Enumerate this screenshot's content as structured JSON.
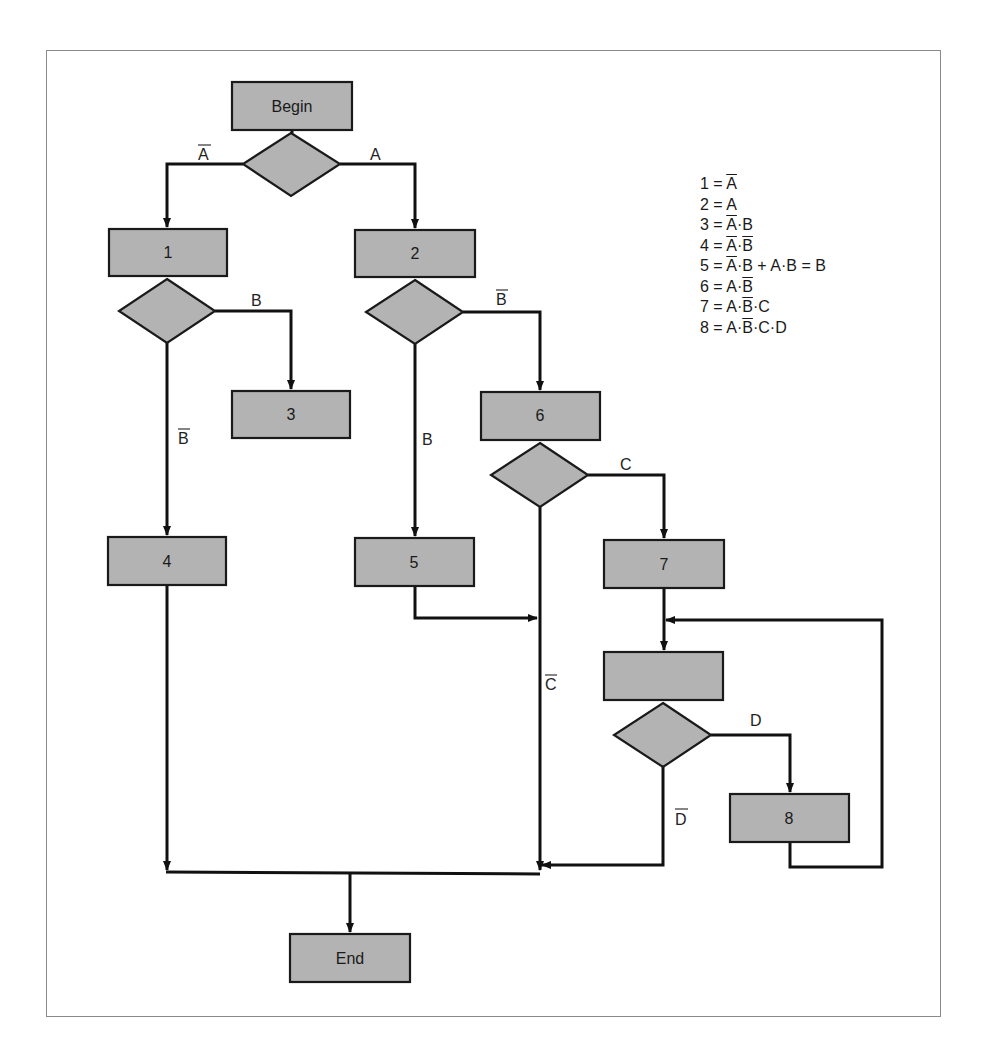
{
  "nodes": {
    "begin": "Begin",
    "p1": "1",
    "p2": "2",
    "p3": "3",
    "p4": "4",
    "p5": "5",
    "p6": "6",
    "p7": "7",
    "p_unlabeled": "",
    "p8": "8",
    "end": "End"
  },
  "edge_labels": {
    "not_a": "A",
    "a": "A",
    "b_from_1": "B",
    "not_b_from_1": "B",
    "not_b_from_2": "B",
    "b_from_2": "B",
    "c": "C",
    "not_c": "C",
    "d": "D",
    "not_d": "D"
  },
  "legend": [
    {
      "num": "1",
      "expr": [
        {
          "t": "A",
          "bar": true
        }
      ]
    },
    {
      "num": "2",
      "expr": [
        {
          "t": "A",
          "bar": false
        }
      ]
    },
    {
      "num": "3",
      "expr": [
        {
          "t": "A",
          "bar": true
        },
        {
          "t": "·",
          "bar": false
        },
        {
          "t": "B",
          "bar": false
        }
      ]
    },
    {
      "num": "4",
      "expr": [
        {
          "t": "A",
          "bar": true
        },
        {
          "t": "·",
          "bar": false
        },
        {
          "t": "B",
          "bar": true
        }
      ]
    },
    {
      "num": "5",
      "expr": [
        {
          "t": "A",
          "bar": true
        },
        {
          "t": "·",
          "bar": false
        },
        {
          "t": "B",
          "bar": false
        },
        {
          "t": " + A·B = B",
          "bar": false
        }
      ]
    },
    {
      "num": "6",
      "expr": [
        {
          "t": "A·",
          "bar": false
        },
        {
          "t": "B",
          "bar": true
        }
      ]
    },
    {
      "num": "7",
      "expr": [
        {
          "t": "A·",
          "bar": false
        },
        {
          "t": "B",
          "bar": true
        },
        {
          "t": "·C",
          "bar": false
        }
      ]
    },
    {
      "num": "8",
      "expr": [
        {
          "t": "A·",
          "bar": false
        },
        {
          "t": "B",
          "bar": true
        },
        {
          "t": "·C·D",
          "bar": false
        }
      ]
    }
  ],
  "colors": {
    "box_fill": "#b3b3b3",
    "stroke": "#111111",
    "frame": "#8a8a8a"
  }
}
